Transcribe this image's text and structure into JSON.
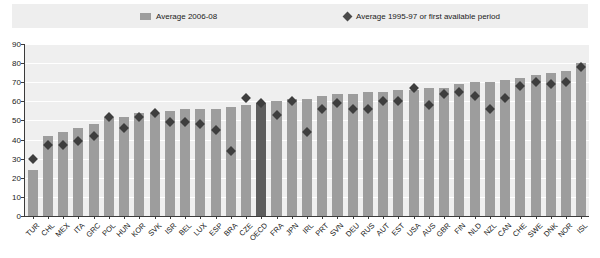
{
  "legend": {
    "bars_label": "Average 2006-08",
    "diamond_label": "Average 1995-97 or first available period",
    "bar_color": "#9d9d9d",
    "diamond_color": "#3e3e3e",
    "highlight_color": "#5d5d5d"
  },
  "chart_data": {
    "type": "bar",
    "title": "",
    "xlabel": "",
    "ylabel": "",
    "ylim": [
      0,
      90
    ],
    "yticks": [
      0,
      10,
      20,
      30,
      40,
      50,
      60,
      70,
      80,
      90
    ],
    "grid": true,
    "legend_position": "top",
    "highlight_category": "OECD",
    "categories": [
      "TUR",
      "CHL",
      "MEX",
      "ITA",
      "GRC",
      "POL",
      "HUN",
      "KOR",
      "SVK",
      "ISR",
      "BEL",
      "LUX",
      "ESP",
      "BRA",
      "CZE",
      "OECD",
      "FRA",
      "JPN",
      "IRL",
      "PRT",
      "SVN",
      "DEU",
      "RUS",
      "AUT",
      "EST",
      "USA",
      "AUS",
      "GBR",
      "FIN",
      "NLD",
      "NZL",
      "CAN",
      "CHE",
      "SWE",
      "DNK",
      "NOR",
      "ISL"
    ],
    "series": [
      {
        "name": "Average 2006-08",
        "type": "bar",
        "values": [
          24,
          42,
          44,
          46,
          48,
          52,
          52,
          54,
          54,
          55,
          56,
          56,
          56,
          57,
          58,
          59,
          60,
          61,
          61,
          63,
          64,
          64,
          65,
          65,
          66,
          66,
          67,
          67,
          69,
          70,
          70,
          71,
          72,
          74,
          75,
          76,
          80
        ]
      },
      {
        "name": "Average 1995-97 or first available period",
        "type": "scatter",
        "values": [
          30,
          37,
          37,
          39,
          42,
          52,
          46,
          52,
          54,
          49,
          49,
          48,
          45,
          34,
          62,
          59,
          53,
          60,
          44,
          56,
          59,
          56,
          56,
          60,
          60,
          67,
          58,
          64,
          65,
          63,
          56,
          62,
          68,
          70,
          69,
          70,
          78
        ]
      }
    ]
  }
}
